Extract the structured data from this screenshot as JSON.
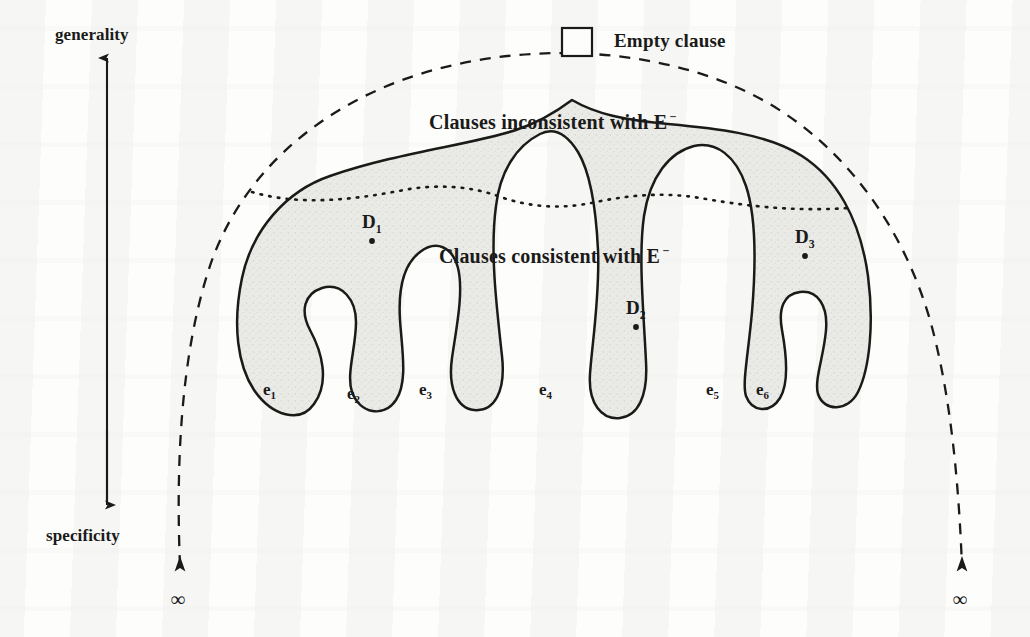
{
  "figure": {
    "type": "concept-lattice-diagram"
  },
  "axis": {
    "top_label": "generality",
    "bottom_label": "specificity",
    "arrow_direction": "up"
  },
  "legend": {
    "empty_clause_label": "Empty clause",
    "empty_clause_symbol": "box-glyph"
  },
  "regions": [
    {
      "id": "inconsistent",
      "label": "Clauses inconsistent with E",
      "superscript": "−"
    },
    {
      "id": "consistent",
      "label": "Clauses consistent with E",
      "superscript": "−"
    }
  ],
  "hypotheses": [
    {
      "id": "D1",
      "letter": "D",
      "index": "1"
    },
    {
      "id": "D2",
      "letter": "D",
      "index": "2"
    },
    {
      "id": "D3",
      "letter": "D",
      "index": "3"
    }
  ],
  "examples": [
    {
      "id": "e1",
      "letter": "e",
      "index": "1"
    },
    {
      "id": "e2",
      "letter": "e",
      "index": "2"
    },
    {
      "id": "e3",
      "letter": "e",
      "index": "3"
    },
    {
      "id": "e4",
      "letter": "e",
      "index": "4"
    },
    {
      "id": "e5",
      "letter": "e",
      "index": "5"
    },
    {
      "id": "e6",
      "letter": "e",
      "index": "6"
    }
  ],
  "infinity": {
    "left_symbol": "∞",
    "right_symbol": "∞"
  },
  "colors": {
    "ink": "#1a1a18",
    "shading": "#e9e9e6",
    "paper": "#fdfdfc"
  }
}
